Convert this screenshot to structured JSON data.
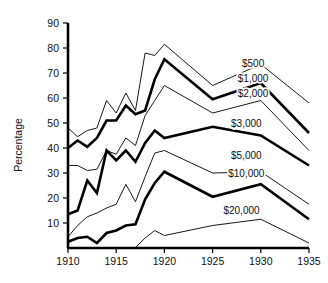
{
  "chart_data": {
    "type": "line",
    "title": "",
    "xlabel": "",
    "ylabel": "Percentage",
    "xlim": [
      1910,
      1935
    ],
    "ylim": [
      0,
      90
    ],
    "grid": false,
    "legend_position": "inline-right",
    "xticks": [
      "1910",
      "1915",
      "1920",
      "1925",
      "1930",
      "1935"
    ],
    "xtick_values": [
      1910,
      1915,
      1920,
      1925,
      1930,
      1935
    ],
    "yticks": [
      "10",
      "20",
      "30",
      "40",
      "50",
      "60",
      "70",
      "80",
      "90"
    ],
    "ytick_values": [
      10,
      20,
      30,
      40,
      50,
      60,
      70,
      80,
      90
    ],
    "x": [
      1910,
      1911,
      1912,
      1913,
      1914,
      1915,
      1916,
      1917,
      1918,
      1919,
      1920,
      1925,
      1930,
      1935
    ],
    "series": [
      {
        "name": "$500",
        "weight": "thin",
        "label_x": 1929.2,
        "label_y": 72.5,
        "values": [
          48,
          44.5,
          47,
          48,
          59,
          54,
          62,
          55,
          78,
          77,
          81.5,
          65,
          73.5,
          58
        ]
      },
      {
        "name": "$1,000",
        "weight": "thick",
        "label_x": 1929.2,
        "label_y": 66.5,
        "values": [
          40,
          43,
          40.5,
          44,
          51,
          51,
          57,
          53.5,
          55,
          67.5,
          75.5,
          59.5,
          66,
          46
        ]
      },
      {
        "name": "$2,000",
        "weight": "thin",
        "label_x": 1929.2,
        "label_y": 60.5,
        "values": [
          33,
          33,
          31,
          31.5,
          39,
          37.5,
          44,
          41,
          53,
          59,
          65,
          54,
          59,
          39
        ]
      },
      {
        "name": "$3,000",
        "weight": "thick",
        "label_x": 1928.5,
        "label_y": 48.5,
        "values": [
          13.5,
          15,
          27,
          22,
          39,
          35,
          39,
          34.5,
          42,
          47,
          44,
          48.5,
          45,
          33
        ]
      },
      {
        "name": "$5,000",
        "weight": "thin",
        "label_x": 1928.5,
        "label_y": 35.5,
        "values": [
          4.5,
          9,
          12.5,
          14,
          16,
          17.5,
          25.5,
          18.5,
          28.5,
          38,
          39,
          30,
          30.5,
          17.5
        ]
      },
      {
        "name": "$10,000",
        "weight": "thick",
        "label_x": 1928.5,
        "label_y": 28.5,
        "values": [
          2.5,
          4,
          4.5,
          2,
          6,
          7,
          9,
          9.5,
          19.5,
          26,
          30.5,
          20.5,
          25.5,
          11.5
        ]
      },
      {
        "name": "$20,000",
        "weight": "thin",
        "label_x": 1928.0,
        "label_y": 13.5,
        "values": [
          0,
          0,
          0,
          0,
          0,
          0,
          0,
          0.2,
          4,
          7,
          5,
          9,
          11.5,
          2
        ]
      }
    ]
  },
  "colors": {
    "line": "#000000",
    "axis": "#000000",
    "text": "#111111",
    "background": "#ffffff"
  }
}
